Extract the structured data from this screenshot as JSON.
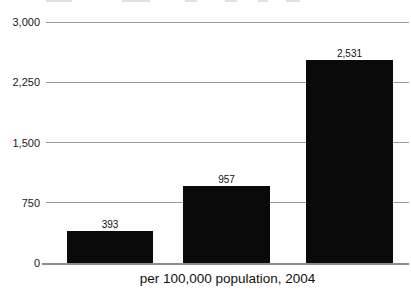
{
  "chart_data": {
    "type": "bar",
    "values": [
      393,
      957,
      2531
    ],
    "value_labels": [
      "393",
      "957",
      "2,531"
    ],
    "title": "",
    "xlabel": "per 100,000 population, 2004",
    "ylabel": "",
    "ylim": [
      0,
      3000
    ],
    "yticks": [
      0,
      750,
      1500,
      2250,
      3000
    ],
    "ytick_labels": [
      "0",
      "750",
      "1,500",
      "2,250",
      "3,000"
    ],
    "grid": true,
    "legend": "none",
    "bar_color": "#0a0a0a",
    "gridline_color": "#9a9a9a",
    "axis_line_color": "#8c8c8c",
    "background_color": "#ffffff"
  }
}
